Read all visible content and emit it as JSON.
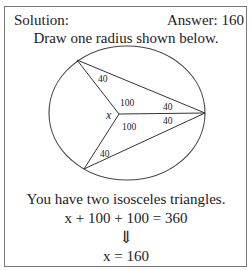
{
  "header": {
    "left": "Solution:",
    "right": "Answer: 160"
  },
  "instruction": "Draw one radius shown below.",
  "diagram": {
    "center_label": "x",
    "angle_labels": {
      "top_left_vertex": "40",
      "center_upper": "100",
      "center_lower": "100",
      "right_upper": "40",
      "right_lower": "40",
      "bottom_left_vertex": "40"
    }
  },
  "explanation": "You have two isosceles triangles.",
  "equation": {
    "lhs": "x + 100 + 100 = 360",
    "arrow": "⇓",
    "result": "x = 160"
  }
}
